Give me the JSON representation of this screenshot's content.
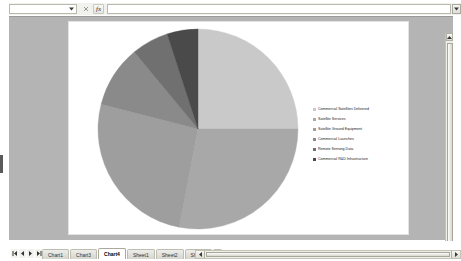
{
  "window": {
    "title": "Excel Chart Sheet"
  },
  "formula_bar": {
    "name_box_value": "",
    "name_box_dropdown_icon": "chevron-down-icon",
    "cancel_icon": "cancel-icon",
    "enter_icon": "enter-icon",
    "function_icon": "fx-icon",
    "function_label": "fx",
    "formula_value": "",
    "expand_icon": "expand-formula-bar-icon"
  },
  "chart_data": {
    "type": "pie",
    "title": "",
    "legend_position": "right",
    "categories": [
      "Commercial Satellites Delivered",
      "Satellite Services",
      "Satellite Ground Equipment",
      "Commercial Launches",
      "Remote Sensing Data",
      "Commercial R&D Infrastructure"
    ],
    "values": [
      25,
      28,
      26,
      10,
      6,
      5
    ],
    "colors": [
      "#c9c9c9",
      "#a8a8a8",
      "#9e9e9e",
      "#8a8a8a",
      "#707070",
      "#4a4a4a"
    ]
  },
  "scrollbars": {
    "vertical_up_icon": "caret-up-icon",
    "vertical_down_icon": "caret-down-icon",
    "horizontal_left_icon": "caret-left-icon",
    "horizontal_right_icon": "caret-right-icon"
  },
  "sheet_tabs": {
    "nav": [
      {
        "name": "first-sheet",
        "icon": "first-icon"
      },
      {
        "name": "prev-sheet",
        "icon": "prev-icon"
      },
      {
        "name": "next-sheet",
        "icon": "next-icon"
      },
      {
        "name": "last-sheet",
        "icon": "last-icon"
      }
    ],
    "items": [
      {
        "label": "Chart1",
        "active": false
      },
      {
        "label": "Chart3",
        "active": false
      },
      {
        "label": "Chart4",
        "active": true
      },
      {
        "label": "Sheet1",
        "active": false
      },
      {
        "label": "Sheet2",
        "active": false
      },
      {
        "label": "Sheet3",
        "active": false
      }
    ],
    "add_sheet_icon": "add-sheet-icon"
  }
}
